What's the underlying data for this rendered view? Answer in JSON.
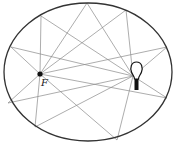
{
  "diagram": {
    "title": "",
    "ellipse": {
      "cx": 88,
      "cy": 72,
      "rx": 84,
      "ry": 69,
      "stroke": "#333333"
    },
    "focus": {
      "label": "F",
      "x": 40,
      "y": 74
    },
    "bulb": {
      "x": 136,
      "y": 72,
      "description": "light bulb at other focus"
    },
    "reflection_points": [
      [
        41,
        16
      ],
      [
        87,
        3
      ],
      [
        126,
        10
      ],
      [
        167,
        47
      ],
      [
        167,
        98
      ],
      [
        117,
        140
      ],
      [
        35,
        127
      ],
      [
        11,
        47
      ],
      [
        8,
        103
      ]
    ],
    "ray_color": "#888888"
  }
}
